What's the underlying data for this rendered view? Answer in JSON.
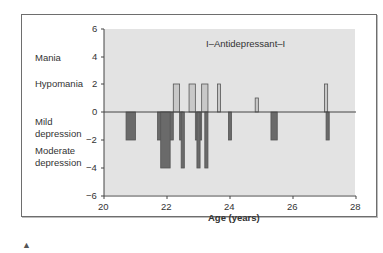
{
  "chart_data": {
    "type": "bar",
    "title": "I–Antidepressant–I",
    "xlabel": "Age (years)",
    "ylabel": "",
    "xlim": [
      20,
      28
    ],
    "ylim": [
      -6,
      6
    ],
    "x_ticks": [
      "20",
      "22",
      "24",
      "26",
      "28"
    ],
    "y_ticks": [
      "6",
      "4",
      "2",
      "0",
      "−2",
      "−4",
      "−6"
    ],
    "mood_labels": [
      "Mania",
      "Hypomania",
      "Mild depression",
      "Moderate depression"
    ],
    "grid": false,
    "legend": "none",
    "colors": {
      "elevated": "#c8c8c8",
      "depressed": "#6a6a6a",
      "background": "#e3e3e3"
    },
    "series": [
      {
        "name": "Elevated mood (hypomania)",
        "bars": [
          {
            "x_start": 22.2,
            "x_end": 22.4,
            "value": 2
          },
          {
            "x_start": 22.7,
            "x_end": 22.9,
            "value": 2
          },
          {
            "x_start": 23.1,
            "x_end": 23.3,
            "value": 2
          },
          {
            "x_start": 23.6,
            "x_end": 23.7,
            "value": 2
          },
          {
            "x_start": 24.8,
            "x_end": 24.9,
            "value": 1
          },
          {
            "x_start": 27.0,
            "x_end": 27.1,
            "value": 2
          }
        ]
      },
      {
        "name": "Depression",
        "bars": [
          {
            "x_start": 20.7,
            "x_end": 21.0,
            "value": -2
          },
          {
            "x_start": 21.7,
            "x_end": 22.2,
            "value": -2
          },
          {
            "x_start": 21.8,
            "x_end": 22.1,
            "value": -4
          },
          {
            "x_start": 22.4,
            "x_end": 22.5,
            "value": -2
          },
          {
            "x_start": 22.45,
            "x_end": 22.55,
            "value": -4
          },
          {
            "x_start": 22.9,
            "x_end": 23.1,
            "value": -2
          },
          {
            "x_start": 22.95,
            "x_end": 23.05,
            "value": -4
          },
          {
            "x_start": 23.2,
            "x_end": 23.3,
            "value": -4
          },
          {
            "x_start": 23.95,
            "x_end": 24.05,
            "value": -2
          },
          {
            "x_start": 25.3,
            "x_end": 25.5,
            "value": -2
          },
          {
            "x_start": 27.05,
            "x_end": 27.15,
            "value": -2
          }
        ]
      }
    ]
  },
  "labels": {
    "title": "I–Antidepressant–I",
    "xlabel": "Age (years)",
    "mania": "Mania",
    "hypomania": "Hypomania",
    "mild1": "Mild",
    "mild2": "depression",
    "mod1": "Moderate",
    "mod2": "depression",
    "y6": "6",
    "y4": "4",
    "y2": "2",
    "y0": "0",
    "ym2": "−2",
    "ym4": "−4",
    "ym6": "−6",
    "x20": "20",
    "x22": "22",
    "x24": "24",
    "x26": "26",
    "x28": "28",
    "mark": "▲"
  }
}
